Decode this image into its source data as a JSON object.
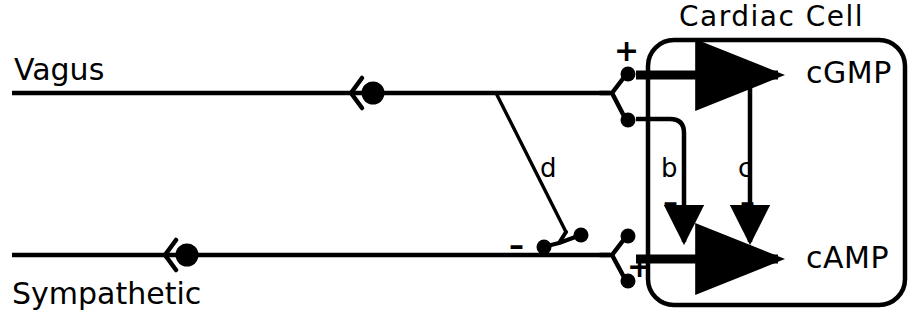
{
  "figure": {
    "title": "Cardiac Cell",
    "nerves": [
      {
        "id": "vagus",
        "label": "Vagus"
      },
      {
        "id": "sympathetic",
        "label": "Sympathetic"
      }
    ],
    "molecules": [
      {
        "id": "cgmp",
        "label": "cGMP"
      },
      {
        "id": "camp",
        "label": "cAMP"
      }
    ],
    "pathways": [
      {
        "id": "a",
        "label": "a",
        "sign": ""
      },
      {
        "id": "b",
        "label": "b",
        "sign": "–"
      },
      {
        "id": "c",
        "label": "c",
        "sign": "–"
      },
      {
        "id": "d",
        "label": "d",
        "sign": ""
      }
    ],
    "signs": {
      "vagus_terminal_plus": "+",
      "sympathetic_terminal_plus": "+",
      "d_terminal_minus": "–",
      "b_minus": "–",
      "c_minus": "–"
    },
    "colors": {
      "ink": "#000000",
      "background": "#ffffff"
    }
  }
}
